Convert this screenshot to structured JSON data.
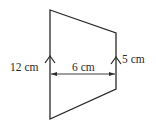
{
  "diagram": {
    "shape": "trapezium",
    "colors": {
      "stroke": "#2a2a2a",
      "background": "#ffffff"
    },
    "vertices": {
      "top_left": [
        50,
        10
      ],
      "top_right": [
        116,
        33
      ],
      "bottom_right": [
        116,
        89
      ],
      "bottom_left": [
        50,
        119
      ]
    },
    "parallel_marks": [
      "arrow-up-left-side",
      "arrow-up-right-side"
    ],
    "labels": {
      "left_side": "12 cm",
      "right_side": "5 cm",
      "height": "6 cm"
    }
  }
}
